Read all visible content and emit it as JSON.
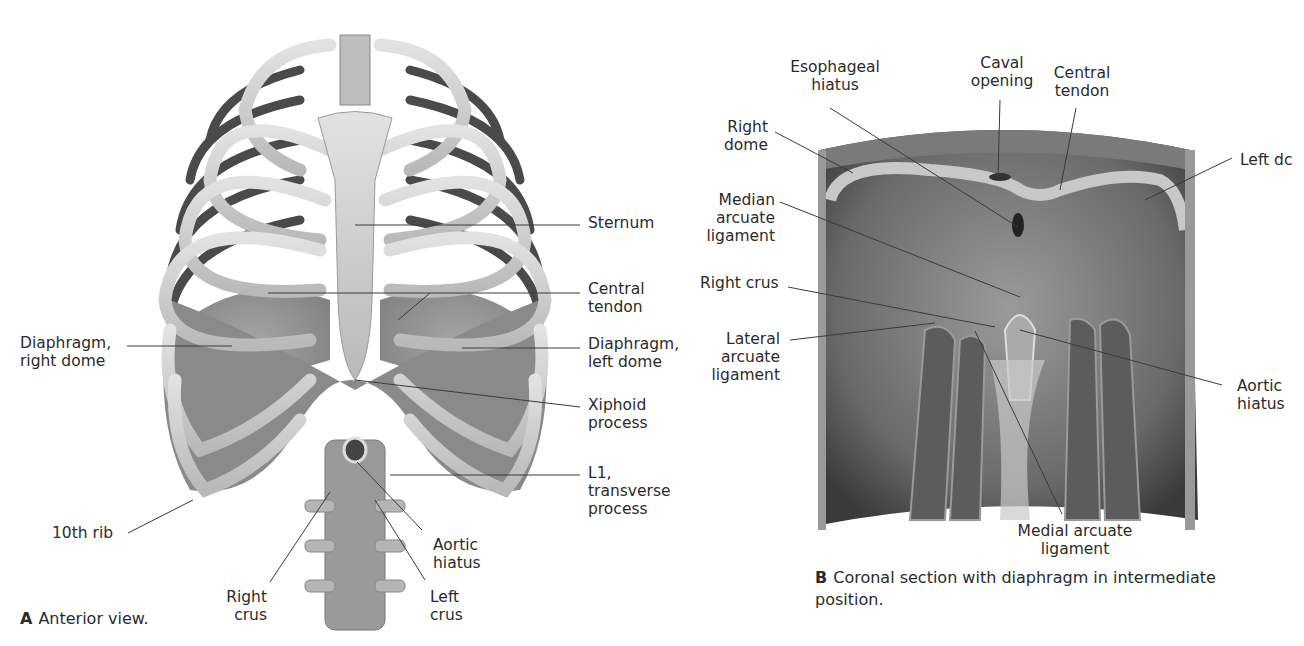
{
  "panel_a": {
    "caption_letter": "A",
    "caption_text": "Anterior view.",
    "labels": {
      "sternum": "Sternum",
      "central_tendon_1": "Central",
      "central_tendon_2": "tendon",
      "diaphragm_left_1": "Diaphragm,",
      "diaphragm_left_2": "left dome",
      "xiphoid_1": "Xiphoid",
      "xiphoid_2": "process",
      "l1_1": "L1,",
      "l1_2": "transverse",
      "l1_3": "process",
      "diaphragm_right_1": "Diaphragm,",
      "diaphragm_right_2": "right dome",
      "tenth_rib": "10th rib",
      "aortic_1": "Aortic",
      "aortic_2": "hiatus",
      "right_crus_1": "Right",
      "right_crus_2": "crus",
      "left_crus_1": "Left",
      "left_crus_2": "crus"
    }
  },
  "panel_b": {
    "caption_letter": "B",
    "caption_line1": "Coronal section with diaphragm in intermediate",
    "caption_line2": "position.",
    "labels": {
      "esophageal_1": "Esophageal",
      "esophageal_2": "hiatus",
      "caval_1": "Caval",
      "caval_2": "opening",
      "central_1": "Central",
      "central_2": "tendon",
      "right_dome_1": "Right",
      "right_dome_2": "dome",
      "left_dome": "Left dc",
      "median_1": "Median",
      "median_2": "arcuate",
      "median_3": "ligament",
      "right_crus": "Right crus",
      "lateral_1": "Lateral",
      "lateral_2": "arcuate",
      "lateral_3": "ligament",
      "aortic_1": "Aortic",
      "aortic_2": "hiatus",
      "medial_1": "Medial arcuate",
      "medial_2": "ligament"
    }
  }
}
